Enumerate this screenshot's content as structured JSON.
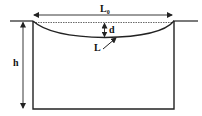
{
  "diagram": {
    "labels": {
      "span": "L",
      "span_sub": "0",
      "depth": "d",
      "curve": "L",
      "height": "h"
    },
    "colors": {
      "stroke": "#222222",
      "background": "#ffffff"
    }
  }
}
